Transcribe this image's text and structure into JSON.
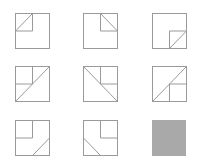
{
  "puzzle": {
    "type": "matrix-reasoning",
    "rows": 3,
    "cols": 3,
    "line_color": "#9a9a9a",
    "answer_fill": "#a9a9a9",
    "cells": [
      {
        "id": "r1c1",
        "description": "outer square; small top-left quadrant square with diagonal from bottom-left to top-right"
      },
      {
        "id": "r1c2",
        "description": "outer square; small top-right quadrant square with diagonal from top-left to bottom-right"
      },
      {
        "id": "r1c3",
        "description": "outer square; small bottom-right quadrant square with diagonal from bottom-left to top-right"
      },
      {
        "id": "r2c1",
        "description": "outer square; top-left quadrant square; full diagonal bottom-left to top-right"
      },
      {
        "id": "r2c2",
        "description": "outer square; top-right quadrant square; full diagonal top-left to bottom-right"
      },
      {
        "id": "r2c3",
        "description": "outer square; bottom-right quadrant square; full diagonal bottom-left to top-right"
      },
      {
        "id": "r3c1",
        "description": "outer square; top-left quadrant square; diagonal in bottom-right quadrant bottom-left to top-right"
      },
      {
        "id": "r3c2",
        "description": "outer square; top-right quadrant square; diagonal in bottom-left quadrant top-left to bottom-right"
      },
      {
        "id": "r3c3",
        "description": "missing cell (gray placeholder)"
      }
    ]
  }
}
